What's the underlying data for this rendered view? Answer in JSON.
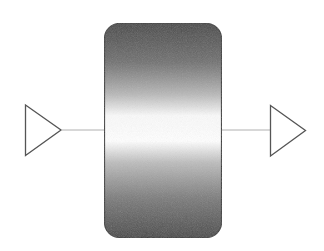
{
  "diagram": {
    "type": "block-with-ports",
    "colors": {
      "background": "#ffffff",
      "port_stroke": "#555555",
      "connector_stroke": "#b0b0b0",
      "body_stroke": "#3a3a3a",
      "gradient_dark": "#4a4a4a",
      "gradient_mid": "#9a9a9a",
      "gradient_light": "#ffffff"
    },
    "input_port": {
      "shape": "triangle-right",
      "label": ""
    },
    "output_port": {
      "shape": "triangle-right",
      "label": ""
    },
    "body": {
      "shape": "rounded-rectangle",
      "fill": "vertical-gradient-dark-white-dark",
      "label": ""
    }
  }
}
